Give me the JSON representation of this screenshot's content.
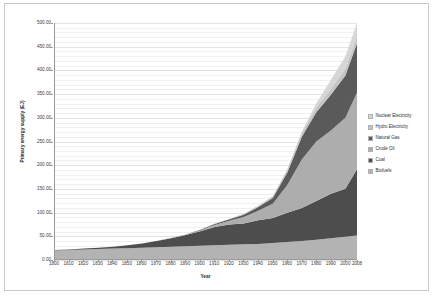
{
  "chart_data": {
    "type": "area",
    "stacked": true,
    "title": "",
    "xlabel": "Year",
    "ylabel": "Primary energy supply (EJ)",
    "xlim": [
      1800,
      2008
    ],
    "ylim": [
      0,
      500
    ],
    "y_tick_step": 50,
    "grid": true,
    "legend_position": "right",
    "y_ticks": [
      "0.00",
      "50.00",
      "100.00",
      "150.00",
      "200.00",
      "250.00",
      "300.00",
      "350.00",
      "400.00",
      "450.00",
      "500.00"
    ],
    "x_ticks": [
      "1800",
      "1810",
      "1820",
      "1830",
      "1840",
      "1850",
      "1860",
      "1870",
      "1880",
      "1890",
      "1900",
      "1910",
      "1920",
      "1930",
      "1940",
      "1950",
      "1960",
      "1970",
      "1980",
      "1990",
      "2000",
      "2008"
    ],
    "x": [
      1800,
      1810,
      1820,
      1830,
      1840,
      1850,
      1860,
      1870,
      1880,
      1890,
      1900,
      1910,
      1920,
      1930,
      1940,
      1950,
      1960,
      1970,
      1980,
      1990,
      2000,
      2008
    ],
    "series": [
      {
        "name": "Biofuels",
        "color": "#b3b3b3",
        "values": [
          18,
          19,
          20,
          21,
          22,
          23,
          24,
          25,
          26,
          27,
          28,
          29,
          30,
          31,
          32,
          34,
          36,
          38,
          41,
          44,
          47,
          50
        ]
      },
      {
        "name": "Coal",
        "color": "#4d4d4d",
        "values": [
          1,
          1,
          2,
          3,
          4,
          6,
          9,
          13,
          18,
          24,
          31,
          39,
          43,
          44,
          50,
          53,
          62,
          70,
          82,
          94,
          102,
          140
        ]
      },
      {
        "name": "Crude Oil",
        "color": "#adadad",
        "values": [
          0,
          0,
          0,
          0,
          0,
          0,
          0,
          0,
          1,
          1,
          2,
          4,
          8,
          14,
          20,
          30,
          59,
          103,
          126,
          134,
          150,
          163
        ]
      },
      {
        "name": "Natural Gas",
        "color": "#5a5a5a",
        "values": [
          0,
          0,
          0,
          0,
          0,
          0,
          0,
          0,
          0,
          0,
          1,
          2,
          3,
          5,
          8,
          12,
          26,
          48,
          62,
          76,
          90,
          104
        ]
      },
      {
        "name": "Hydro Electricity",
        "color": "#c4c4c4",
        "values": [
          0,
          0,
          0,
          0,
          0,
          0,
          0,
          0,
          0,
          0,
          0,
          1,
          1,
          2,
          3,
          4,
          6,
          8,
          10,
          12,
          14,
          15
        ]
      },
      {
        "name": "Nuclear Electricity",
        "color": "#d6d6d6",
        "values": [
          0,
          0,
          0,
          0,
          0,
          0,
          0,
          0,
          0,
          0,
          0,
          0,
          0,
          0,
          0,
          0,
          1,
          3,
          9,
          19,
          26,
          28
        ]
      }
    ],
    "legend_order": [
      "Nuclear Electricity",
      "Hydro Electricity",
      "Natural Gas",
      "Crude Oil",
      "Coal",
      "Biofuels"
    ]
  }
}
